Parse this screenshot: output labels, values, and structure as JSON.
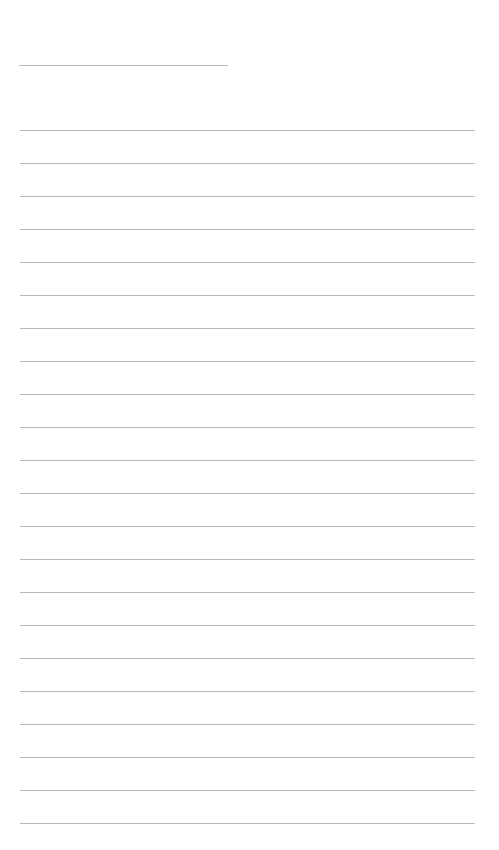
{
  "page": {
    "type": "blank lined page",
    "line_color": "#b8b8b8",
    "background": "#ffffff",
    "title_line": {
      "top": 65,
      "left": 19,
      "width": 209
    },
    "ruled_lines": {
      "first_top": 130,
      "spacing": 33,
      "count": 22,
      "left": 20,
      "width": 455
    }
  }
}
